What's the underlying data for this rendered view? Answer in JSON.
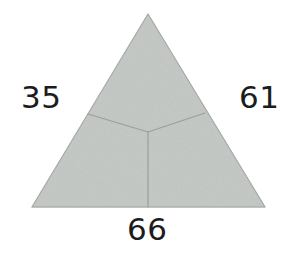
{
  "figure": {
    "name": "triangle-partition-diagram",
    "background_color": "#ffffff",
    "fill_color": "#c3c7c4",
    "outline_color": "#a9aeab",
    "divider_color": "#9aa09c",
    "label_color": "#1c1c1c",
    "shape": {
      "type": "triangle",
      "apex": [
        148,
        14
      ],
      "bottom_left": [
        32,
        207
      ],
      "bottom_right": [
        265,
        207
      ],
      "centroid": [
        148,
        132
      ],
      "divider_endpoints": [
        [
          88,
          114
        ],
        [
          205,
          113
        ],
        [
          148,
          207
        ]
      ]
    }
  },
  "labels": {
    "left": "35",
    "right": "61",
    "bottom": "66"
  }
}
